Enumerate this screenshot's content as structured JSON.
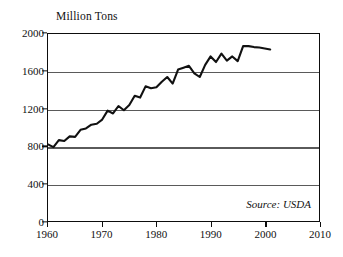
{
  "chart_data": {
    "type": "line",
    "title": "Million Tons",
    "xlabel": "",
    "ylabel": "Million Tons",
    "xlim": [
      1960,
      2010
    ],
    "ylim": [
      0,
      2000
    ],
    "grid": true,
    "legend": null,
    "source_note": "Source: USDA",
    "y_ticks": [
      0,
      400,
      800,
      1200,
      1600,
      2000
    ],
    "x_ticks": [
      1960,
      1970,
      1980,
      1990,
      2000,
      2010
    ],
    "series": [
      {
        "name": "World Grain Production",
        "x": [
          1960,
          1961,
          1962,
          1963,
          1964,
          1965,
          1966,
          1967,
          1968,
          1969,
          1970,
          1971,
          1972,
          1973,
          1974,
          1975,
          1976,
          1977,
          1978,
          1979,
          1980,
          1981,
          1982,
          1983,
          1984,
          1985,
          1986,
          1987,
          1988,
          1989,
          1990,
          1991,
          1992,
          1993,
          1994,
          1995,
          1996,
          1997,
          1998,
          1999,
          2000,
          2001
        ],
        "values": [
          820,
          790,
          865,
          855,
          905,
          900,
          975,
          990,
          1030,
          1040,
          1085,
          1180,
          1150,
          1230,
          1185,
          1240,
          1340,
          1320,
          1440,
          1420,
          1430,
          1490,
          1540,
          1470,
          1620,
          1640,
          1660,
          1580,
          1540,
          1670,
          1760,
          1700,
          1790,
          1715,
          1760,
          1710,
          1870,
          1870,
          1860,
          1855,
          1845,
          1835
        ]
      }
    ]
  }
}
